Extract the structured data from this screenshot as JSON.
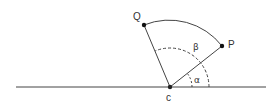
{
  "diagram": {
    "type": "geometry",
    "points": {
      "C": {
        "label": "c",
        "x": 170,
        "y": 87
      },
      "P": {
        "label": "P",
        "x": 222,
        "y": 46
      },
      "Q": {
        "label": "Q",
        "x": 144,
        "y": 25
      }
    },
    "angles": {
      "alpha": {
        "label": "α"
      },
      "beta": {
        "label": "β"
      }
    },
    "colors": {
      "stroke": "#333333",
      "point": "#111111"
    }
  }
}
